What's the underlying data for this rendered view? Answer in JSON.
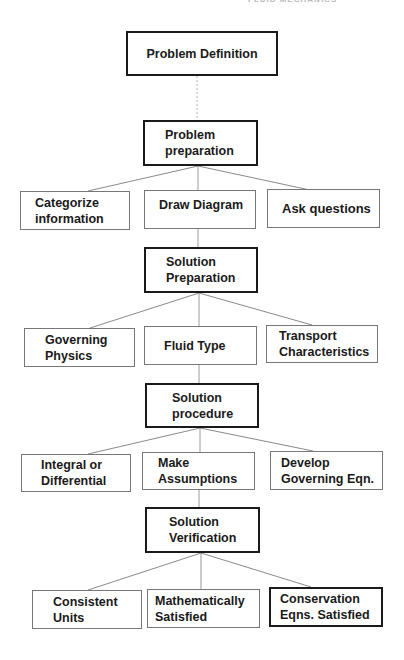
{
  "header_fragment": "FLUID MECHANICS",
  "diagram": {
    "type": "flowchart",
    "root": {
      "id": "problem-definition",
      "label": "Problem Definition"
    },
    "stages": [
      {
        "id": "problem-preparation",
        "label": "Problem\npreparation",
        "children": [
          {
            "label": "Categorize\ninformation"
          },
          {
            "label": "Draw Diagram"
          },
          {
            "label": "Ask questions"
          }
        ]
      },
      {
        "id": "solution-preparation",
        "label": "Solution\nPreparation",
        "children": [
          {
            "label": "Governing\nPhysics"
          },
          {
            "label": "Fluid Type"
          },
          {
            "label": "Transport\nCharacteristics"
          }
        ]
      },
      {
        "id": "solution-procedure",
        "label": "Solution\nprocedure",
        "children": [
          {
            "label": "Integral or\nDifferential"
          },
          {
            "label": "Make\nAssumptions"
          },
          {
            "label": "Develop\nGoverning Eqn."
          }
        ]
      },
      {
        "id": "solution-verification",
        "label": "Solution\nVerification",
        "children": [
          {
            "label": "Consistent\nUnits"
          },
          {
            "label": "Mathematically\nSatisfied"
          },
          {
            "label": "Conservation\nEqns. Satisfied",
            "emphasized": true
          }
        ]
      }
    ]
  },
  "colors": {
    "ink": "#1a1a1a",
    "thin_border": "#777777",
    "connector": "#8a8a8a",
    "background": "#ffffff"
  }
}
